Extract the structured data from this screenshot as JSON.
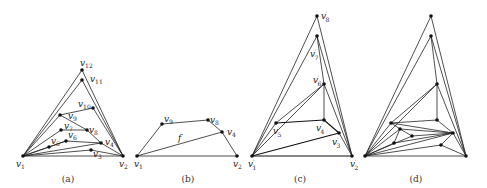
{
  "figure": {
    "panels": [
      {
        "id": "a",
        "caption": "(a)",
        "vertices": [
          {
            "name": "v1",
            "label": "v",
            "sub": "1",
            "x": 23,
            "y": 156,
            "lx": 16,
            "ly": 167
          },
          {
            "name": "v2",
            "label": "v",
            "sub": "2",
            "x": 123,
            "y": 156,
            "lx": 119,
            "ly": 167
          },
          {
            "name": "v3",
            "label": "v",
            "sub": "3",
            "x": 91,
            "y": 150,
            "lx": 93,
            "ly": 157
          },
          {
            "name": "v4",
            "label": "v",
            "sub": "4",
            "x": 101,
            "y": 143,
            "lx": 105,
            "ly": 145
          },
          {
            "name": "v5",
            "label": "v",
            "sub": "5",
            "x": 49,
            "y": 147,
            "lx": 51,
            "ly": 144
          },
          {
            "name": "v6",
            "label": "v",
            "sub": "6",
            "x": 66,
            "y": 141,
            "lx": 68,
            "ly": 138
          },
          {
            "name": "v7",
            "label": "v",
            "sub": "7",
            "x": 61,
            "y": 130,
            "lx": 64,
            "ly": 129
          },
          {
            "name": "v8",
            "label": "v",
            "sub": "8",
            "x": 87,
            "y": 130,
            "lx": 89,
            "ly": 133
          },
          {
            "name": "v9",
            "label": "v",
            "sub": "9",
            "x": 60,
            "y": 115,
            "lx": 68,
            "ly": 119
          },
          {
            "name": "v10",
            "label": "v",
            "sub": "10",
            "x": 93,
            "y": 108,
            "lx": 78,
            "ly": 107
          },
          {
            "name": "v11",
            "label": "v",
            "sub": "11",
            "x": 82,
            "y": 80,
            "lx": 90,
            "ly": 82
          },
          {
            "name": "v12",
            "label": "v",
            "sub": "12",
            "x": 82,
            "y": 70,
            "lx": 80,
            "ly": 66
          }
        ],
        "edges": [
          [
            "v1",
            "v2"
          ],
          [
            "v1",
            "v12"
          ],
          [
            "v12",
            "v2"
          ],
          [
            "v1",
            "v11"
          ],
          [
            "v11",
            "v2"
          ],
          [
            "v1",
            "v9"
          ],
          [
            "v9",
            "v10"
          ],
          [
            "v10",
            "v2"
          ],
          [
            "v9",
            "v8"
          ],
          [
            "v8",
            "v4"
          ],
          [
            "v1",
            "v7"
          ],
          [
            "v7",
            "v8"
          ],
          [
            "v1",
            "v5"
          ],
          [
            "v5",
            "v6"
          ],
          [
            "v6",
            "v4"
          ],
          [
            "v1",
            "v4"
          ],
          [
            "v4",
            "v2"
          ],
          [
            "v1",
            "v3"
          ],
          [
            "v3",
            "v2"
          ],
          [
            "v1",
            "v6"
          ]
        ]
      },
      {
        "id": "b",
        "caption": "(b)",
        "face_label": "f",
        "face_label_pos": {
          "x": 178,
          "y": 141
        },
        "vertices": [
          {
            "name": "v1",
            "label": "v",
            "sub": "1",
            "x": 137,
            "y": 156,
            "lx": 134,
            "ly": 167
          },
          {
            "name": "v2",
            "label": "v",
            "sub": "2",
            "x": 237,
            "y": 156,
            "lx": 233,
            "ly": 167
          },
          {
            "name": "v9",
            "label": "v",
            "sub": "9",
            "x": 162,
            "y": 124,
            "lx": 164,
            "ly": 122
          },
          {
            "name": "v8",
            "label": "v",
            "sub": "8",
            "x": 208,
            "y": 120,
            "lx": 210,
            "ly": 123
          },
          {
            "name": "v4",
            "label": "v",
            "sub": "4",
            "x": 222,
            "y": 132,
            "lx": 227,
            "ly": 135
          }
        ],
        "edges": [
          [
            "v1",
            "v2"
          ],
          [
            "v1",
            "v9"
          ],
          [
            "v9",
            "v8"
          ],
          [
            "v8",
            "v4"
          ],
          [
            "v4",
            "v2"
          ],
          [
            "v1",
            "v4"
          ]
        ]
      },
      {
        "id": "c",
        "caption": "(c)",
        "vertices": [
          {
            "name": "v1p",
            "label": "v",
            "sub": "1",
            "prime": true,
            "x": 252,
            "y": 156,
            "lx": 248,
            "ly": 167
          },
          {
            "name": "v2p",
            "label": "v",
            "sub": "2",
            "prime": true,
            "x": 352,
            "y": 156,
            "lx": 350,
            "ly": 167
          },
          {
            "name": "v3p",
            "label": "v",
            "sub": "3",
            "prime": true,
            "x": 339,
            "y": 133,
            "lx": 332,
            "ly": 145
          },
          {
            "name": "v4p",
            "label": "v",
            "sub": "4",
            "prime": true,
            "x": 324,
            "y": 120,
            "lx": 316,
            "ly": 131
          },
          {
            "name": "v5p",
            "label": "v",
            "sub": "5",
            "prime": true,
            "x": 276,
            "y": 123,
            "lx": 273,
            "ly": 134
          },
          {
            "name": "v6p",
            "label": "v",
            "sub": "6",
            "prime": true,
            "x": 324,
            "y": 84,
            "lx": 313,
            "ly": 83
          },
          {
            "name": "v7p",
            "label": "v",
            "sub": "7",
            "prime": true,
            "x": 317,
            "y": 36,
            "lx": 310,
            "ly": 57
          },
          {
            "name": "v8p",
            "label": "v",
            "sub": "8",
            "prime": true,
            "x": 317,
            "y": 16,
            "lx": 321,
            "ly": 19
          }
        ],
        "edges": [
          [
            "v1p",
            "v2p"
          ],
          [
            "v1p",
            "v8p"
          ],
          [
            "v8p",
            "v2p"
          ],
          [
            "v1p",
            "v7p"
          ],
          [
            "v7p",
            "v2p"
          ],
          [
            "v1p",
            "v6p"
          ],
          [
            "v6p",
            "v4p"
          ],
          [
            "v6p",
            "v2p"
          ],
          [
            "v5p",
            "v6p"
          ],
          [
            "v5p",
            "v4p"
          ],
          [
            "v4p",
            "v3p"
          ],
          [
            "v3p",
            "v2p"
          ],
          [
            "v1p",
            "v3p"
          ],
          [
            "v1p",
            "v5p"
          ],
          [
            "v7p",
            "v6p"
          ]
        ],
        "thick_edges": [
          [
            "v5p",
            "v4p"
          ],
          [
            "v4p",
            "v3p"
          ],
          [
            "v1p",
            "v3p"
          ],
          [
            "v1p",
            "v2p"
          ]
        ]
      },
      {
        "id": "d",
        "caption": "(d)",
        "vertices": [
          {
            "name": "d1",
            "x": 365,
            "y": 156
          },
          {
            "name": "d2",
            "x": 466,
            "y": 156
          },
          {
            "name": "d3",
            "x": 431,
            "y": 16
          },
          {
            "name": "d4",
            "x": 431,
            "y": 36
          },
          {
            "name": "d5",
            "x": 437,
            "y": 84
          },
          {
            "name": "d6",
            "x": 391,
            "y": 123
          },
          {
            "name": "d7",
            "x": 437,
            "y": 120
          },
          {
            "name": "d8",
            "x": 453,
            "y": 133
          },
          {
            "name": "d9",
            "x": 400,
            "y": 129
          },
          {
            "name": "d10",
            "x": 412,
            "y": 136
          },
          {
            "name": "d11",
            "x": 394,
            "y": 143
          },
          {
            "name": "d12",
            "x": 441,
            "y": 145
          }
        ],
        "edges": [
          [
            "d1",
            "d2"
          ],
          [
            "d1",
            "d3"
          ],
          [
            "d3",
            "d2"
          ],
          [
            "d1",
            "d4"
          ],
          [
            "d4",
            "d2"
          ],
          [
            "d1",
            "d5"
          ],
          [
            "d5",
            "d7"
          ],
          [
            "d5",
            "d2"
          ],
          [
            "d6",
            "d5"
          ],
          [
            "d6",
            "d7"
          ],
          [
            "d7",
            "d8"
          ],
          [
            "d8",
            "d2"
          ],
          [
            "d1",
            "d6"
          ],
          [
            "d4",
            "d5"
          ],
          [
            "d6",
            "d9"
          ],
          [
            "d9",
            "d8"
          ],
          [
            "d9",
            "d10"
          ],
          [
            "d10",
            "d8"
          ],
          [
            "d9",
            "d11"
          ],
          [
            "d11",
            "d8"
          ],
          [
            "d1",
            "d11"
          ],
          [
            "d1",
            "d10"
          ],
          [
            "d1",
            "d9"
          ],
          [
            "d1",
            "d8"
          ],
          [
            "d1",
            "d12"
          ],
          [
            "d12",
            "d8"
          ],
          [
            "d12",
            "d2"
          ],
          [
            "d6",
            "d8"
          ]
        ]
      }
    ],
    "captions": [
      {
        "text": "(a)",
        "x": 68,
        "y": 182
      },
      {
        "text": "(b)",
        "x": 188,
        "y": 182
      },
      {
        "text": "(c)",
        "x": 300,
        "y": 182
      },
      {
        "text": "(d)",
        "x": 416,
        "y": 182
      }
    ]
  }
}
